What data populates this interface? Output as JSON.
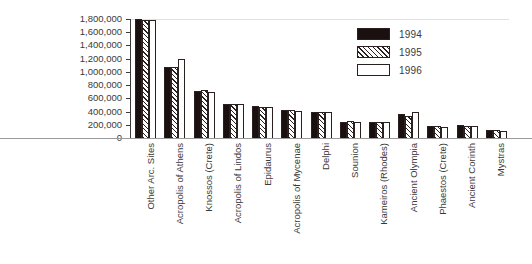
{
  "chart_data": {
    "type": "bar",
    "title": "",
    "xlabel": "",
    "ylabel": "",
    "ylim": [
      0,
      1800000
    ],
    "grid": false,
    "legend_position": "top-right",
    "ytick_labels": [
      "1,800,000",
      "1,600,000",
      "1,400,000",
      "1,200,000",
      "1,000,000",
      "800,000",
      "600,000",
      "400,000",
      "200,000",
      "0"
    ],
    "ytick_values": [
      1800000,
      1600000,
      1400000,
      1200000,
      1000000,
      800000,
      600000,
      400000,
      200000,
      0
    ],
    "categories": [
      "Other Arc. Sites",
      "Acropolis of Athens",
      "Knossos (Crete)",
      "Acropolis of Lindos",
      "Epidaurus",
      "Acropolis of Mycenae",
      "Delphi",
      "Sounion",
      "Kameiros (Rhodes)",
      "Ancient Olympia",
      "Phaestos (Crete)",
      "Ancient Corinth",
      "Mystras"
    ],
    "series": [
      {
        "name": "1994",
        "values": [
          1800000,
          1080000,
          710000,
          520000,
          480000,
          430000,
          400000,
          250000,
          250000,
          360000,
          180000,
          190000,
          120000
        ]
      },
      {
        "name": "1995",
        "values": [
          1790000,
          1080000,
          720000,
          520000,
          470000,
          420000,
          400000,
          260000,
          250000,
          340000,
          180000,
          180000,
          120000
        ]
      },
      {
        "name": "1996",
        "values": [
          1780000,
          1190000,
          700000,
          510000,
          470000,
          410000,
          390000,
          250000,
          240000,
          390000,
          170000,
          180000,
          110000
        ]
      }
    ]
  },
  "legend": {
    "entries": [
      {
        "label": "1994",
        "style": "s1994",
        "color": "#1a1010"
      },
      {
        "label": "1995",
        "style": "s1995",
        "color": "#ffffff"
      },
      {
        "label": "1996",
        "style": "s1996",
        "color": "#ffffff"
      }
    ]
  },
  "colors": {
    "series_1994": "#1a1010",
    "series_1996": "#ffffff",
    "outline": "#2a2020",
    "axis": "#3a3a3a",
    "baseline": "#9a9a9a",
    "background": "#ffffff"
  }
}
